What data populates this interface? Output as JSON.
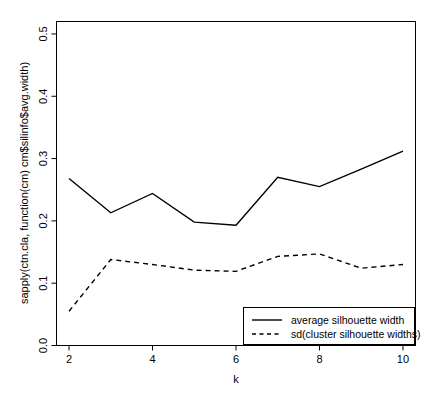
{
  "chart_data": {
    "type": "line",
    "title": "",
    "subtitle": "",
    "xlabel": "k",
    "ylabel": "sapply(ctn.cla, function(cm) cm$silinfo$avg.width)",
    "x": [
      2,
      3,
      4,
      5,
      6,
      7,
      8,
      9,
      10
    ],
    "xlim": [
      1.7,
      10.3
    ],
    "ylim": [
      0.0,
      0.52
    ],
    "xticks": [
      2,
      4,
      6,
      8,
      10
    ],
    "xtick_labels": [
      "2",
      "4",
      "6",
      "8",
      "10"
    ],
    "yticks": [
      0.0,
      0.1,
      0.2,
      0.3,
      0.4,
      0.5
    ],
    "ytick_labels": [
      "0.0",
      "0.1",
      "0.2",
      "0.3",
      "0.4",
      "0.5"
    ],
    "grid": false,
    "legend_position": "bottom-right",
    "series": [
      {
        "name": "average silhouette width",
        "style": "solid",
        "color": "#000000",
        "values": [
          0.268,
          0.213,
          0.244,
          0.198,
          0.193,
          0.27,
          0.255,
          0.283,
          0.312
        ]
      },
      {
        "name": "sd(cluster silhouette widths)",
        "style": "dashed",
        "color": "#000000",
        "values": [
          0.055,
          0.138,
          0.13,
          0.121,
          0.119,
          0.143,
          0.147,
          0.124,
          0.13
        ]
      }
    ]
  },
  "legend": {
    "entries": [
      {
        "label": "average silhouette width",
        "style": "solid"
      },
      {
        "label": "sd(cluster silhouette widths)",
        "style": "dashed"
      }
    ]
  },
  "axes": {
    "x_title": "k",
    "y_title": "sapply(ctn.cla, function(cm) cm$silinfo$avg.width)"
  },
  "colors": {
    "background": "#ffffff",
    "foreground": "#000000"
  }
}
